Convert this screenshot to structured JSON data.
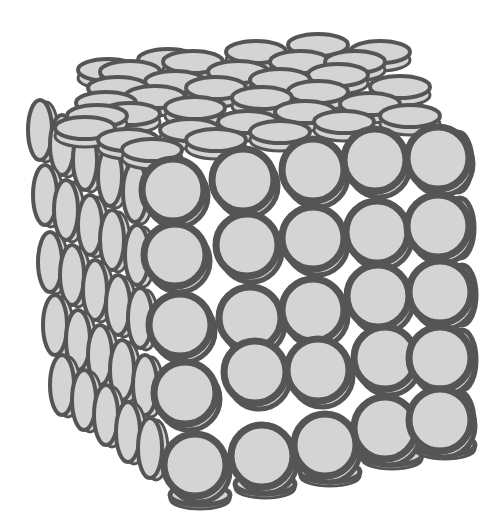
{
  "figure": {
    "colors": {
      "background": "#ffffff",
      "disc_fill": "#d4d4d4",
      "disc_stroke": "#555555",
      "gap": "#ffffff"
    },
    "lattice": {
      "nx": 5,
      "ny": 5,
      "nz": 5
    },
    "front_face": {
      "orientation": "discs facing viewer",
      "radius": 31,
      "stroke_width": 7,
      "discs": [
        [
          173,
          190
        ],
        [
          243,
          180
        ],
        [
          313,
          170
        ],
        [
          375,
          160
        ],
        [
          438,
          158
        ],
        [
          175,
          255
        ],
        [
          247,
          245
        ],
        [
          313,
          238
        ],
        [
          377,
          232
        ],
        [
          438,
          226
        ],
        [
          180,
          325
        ],
        [
          250,
          318
        ],
        [
          313,
          310
        ],
        [
          378,
          296
        ],
        [
          440,
          292
        ],
        [
          185,
          393
        ],
        [
          255,
          372
        ],
        [
          318,
          370
        ],
        [
          385,
          358
        ],
        [
          440,
          358
        ],
        [
          195,
          465
        ],
        [
          262,
          456
        ],
        [
          325,
          445
        ],
        [
          385,
          428
        ],
        [
          440,
          420
        ]
      ]
    },
    "top_face": {
      "orientation": "discs seen edge-on from above (horizontal ellipses)",
      "rx": 30,
      "ry": 11,
      "stroke_width": 4,
      "discs": [
        [
          130,
          72
        ],
        [
          193,
          62
        ],
        [
          256,
          52
        ],
        [
          318,
          45
        ],
        [
          380,
          52
        ],
        [
          118,
          88
        ],
        [
          175,
          82
        ],
        [
          238,
          72
        ],
        [
          300,
          62
        ],
        [
          355,
          62
        ],
        [
          106,
          103
        ],
        [
          155,
          97
        ],
        [
          216,
          88
        ],
        [
          280,
          80
        ],
        [
          338,
          75
        ],
        [
          97,
          116
        ],
        [
          130,
          114
        ],
        [
          195,
          108
        ],
        [
          262,
          98
        ],
        [
          318,
          92
        ],
        [
          400,
          87
        ],
        [
          85,
          128
        ],
        [
          128,
          140
        ],
        [
          190,
          130
        ],
        [
          248,
          122
        ],
        [
          305,
          112
        ],
        [
          370,
          104
        ],
        [
          152,
          150
        ],
        [
          216,
          140
        ],
        [
          280,
          132
        ],
        [
          344,
          122
        ],
        [
          410,
          116
        ],
        [
          108,
          70
        ],
        [
          168,
          60
        ]
      ]
    },
    "left_face": {
      "orientation": "discs seen edge-on from the side (vertical ellipses)",
      "rx": 12,
      "ry": 30,
      "stroke_width": 4,
      "discs": [
        [
          40,
          130
        ],
        [
          62,
          145
        ],
        [
          85,
          160
        ],
        [
          110,
          176
        ],
        [
          135,
          192
        ],
        [
          45,
          195
        ],
        [
          66,
          210
        ],
        [
          90,
          225
        ],
        [
          112,
          240
        ],
        [
          137,
          255
        ],
        [
          50,
          262
        ],
        [
          72,
          275
        ],
        [
          95,
          290
        ],
        [
          118,
          305
        ],
        [
          140,
          318
        ],
        [
          55,
          325
        ],
        [
          78,
          340
        ],
        [
          100,
          355
        ],
        [
          122,
          370
        ],
        [
          145,
          385
        ],
        [
          62,
          385
        ],
        [
          84,
          400
        ],
        [
          106,
          415
        ],
        [
          128,
          432
        ],
        [
          150,
          448
        ]
      ]
    },
    "right_face": {
      "orientation": "partial side edges visible behind front column",
      "rx": 14,
      "ry": 30,
      "stroke_width": 5,
      "discs": [
        [
          458,
          162
        ],
        [
          460,
          228
        ],
        [
          462,
          295
        ],
        [
          462,
          360
        ],
        [
          460,
          422
        ]
      ]
    },
    "bottom_edge": {
      "rx": 30,
      "ry": 10,
      "stroke_width": 5,
      "discs": [
        [
          200,
          495
        ],
        [
          265,
          484
        ],
        [
          330,
          472
        ],
        [
          392,
          455
        ],
        [
          445,
          445
        ]
      ]
    }
  }
}
